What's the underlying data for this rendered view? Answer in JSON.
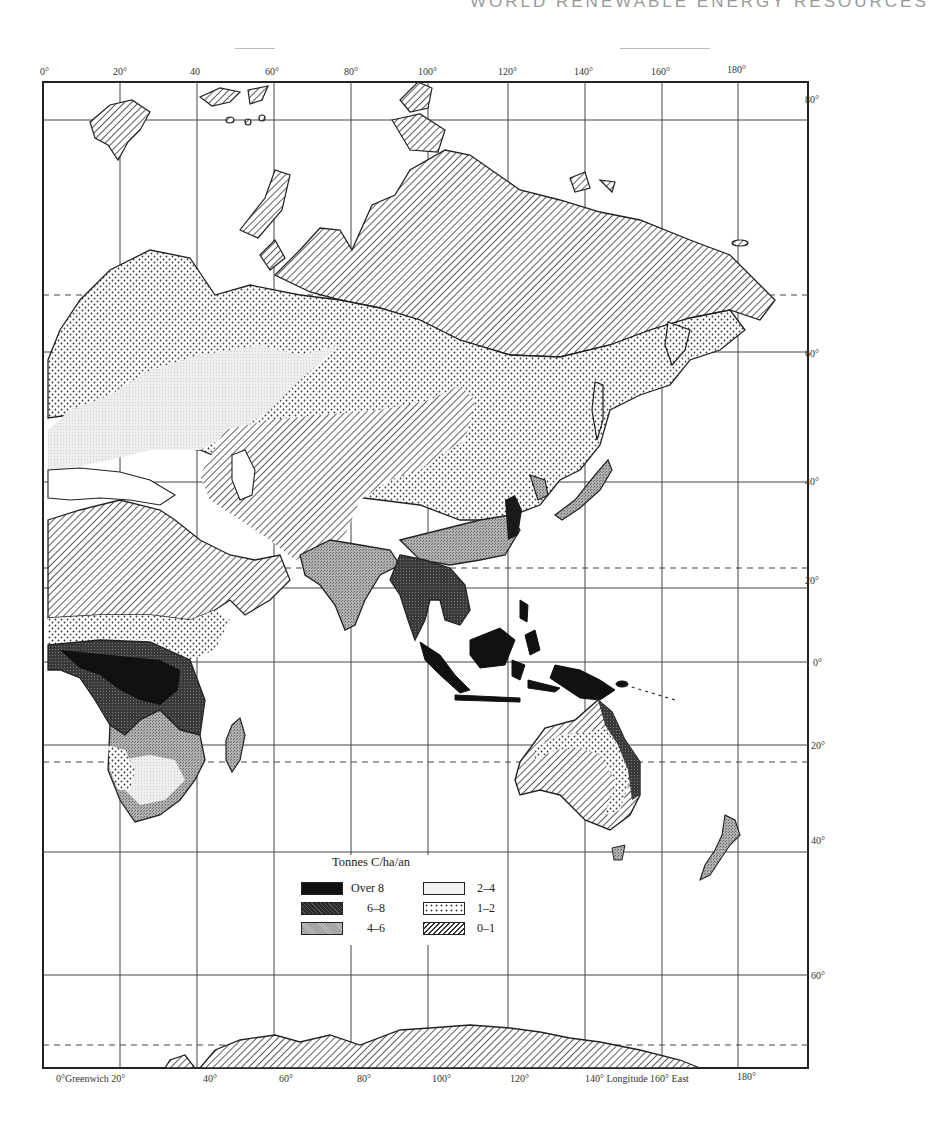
{
  "page": {
    "running_head": "WORLD RENEWABLE ENERGY RESOURCES"
  },
  "map": {
    "subject": "Net primary productivity of land vegetation, Eastern Hemisphere",
    "frame": {
      "left": 43,
      "top": 82,
      "right": 808,
      "bottom": 1068
    },
    "longitude_labels_top": [
      {
        "text": "0°",
        "x": 40
      },
      {
        "text": "20°",
        "x": 113
      },
      {
        "text": "40",
        "x": 190
      },
      {
        "text": "60°",
        "x": 265
      },
      {
        "text": "80°",
        "x": 344
      },
      {
        "text": "100°",
        "x": 418
      },
      {
        "text": "120°",
        "x": 498
      },
      {
        "text": "140°",
        "x": 574
      },
      {
        "text": "160°",
        "x": 651
      },
      {
        "text": "180°",
        "x": 727
      }
    ],
    "longitude_labels_bottom": [
      {
        "text": "0°Greenwich 20°",
        "x": 56
      },
      {
        "text": "40°",
        "x": 203
      },
      {
        "text": "60°",
        "x": 279
      },
      {
        "text": "80°",
        "x": 357
      },
      {
        "text": "100°",
        "x": 432
      },
      {
        "text": "120°",
        "x": 510
      },
      {
        "text": "140° Longitude 160° East",
        "x": 585
      },
      {
        "text": "180°",
        "x": 737
      }
    ],
    "latitude_labels_right": [
      {
        "text": "80°",
        "y": 94
      },
      {
        "text": "60°",
        "y": 348
      },
      {
        "text": "40°",
        "y": 476
      },
      {
        "text": "20°",
        "y": 575
      },
      {
        "text": "0°",
        "y": 657
      },
      {
        "text": "20°",
        "y": 740
      },
      {
        "text": "40°",
        "y": 835
      },
      {
        "text": "60°",
        "y": 970
      }
    ],
    "legend": {
      "title": "Tonnes C/ha/an",
      "items": [
        {
          "label": "Over 8",
          "pattern": "solid-black",
          "color": "#111111"
        },
        {
          "label": "6–8",
          "pattern": "dark-crosshatch",
          "color": "#3a3a3a"
        },
        {
          "label": "4–6",
          "pattern": "medium-stipple",
          "color": "#9a9a9a"
        },
        {
          "label": "2–4",
          "pattern": "light-fill",
          "color": "#e6e6e6"
        },
        {
          "label": "1–2",
          "pattern": "dots",
          "color": "#ffffff"
        },
        {
          "label": "0–1",
          "pattern": "diagonal-hatch",
          "color": "#ffffff"
        }
      ]
    }
  }
}
